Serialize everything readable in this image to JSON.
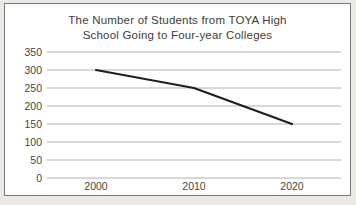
{
  "chart_data": {
    "type": "line",
    "title": "The Number of Students from TOYA High School Going to Four-year Colleges",
    "title_lines": [
      "The Number of Students from TOYA High",
      "School Going to Four-year Colleges"
    ],
    "categories": [
      "2000",
      "2010",
      "2020"
    ],
    "series": [
      {
        "name": "students",
        "values": [
          300,
          250,
          150
        ]
      }
    ],
    "xlabel": "",
    "ylabel": "",
    "ylim": [
      0,
      350
    ],
    "ytick_step": 50,
    "yticks": [
      350,
      300,
      250,
      200,
      150,
      100,
      50,
      0
    ],
    "grid": "horizontal",
    "legend": "none"
  },
  "colors": {
    "line": "#1f1f1f",
    "gridline": "#b2b0ae",
    "frame_border": "#7a7a7a",
    "plot_background": "#ffffff",
    "outer_background": "#ece9e4",
    "text": "#474747",
    "title_text": "#3d3d3d"
  }
}
